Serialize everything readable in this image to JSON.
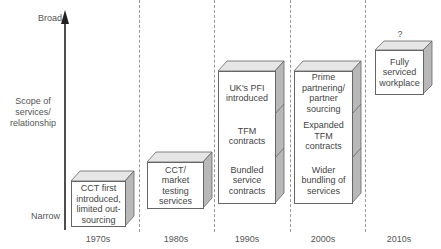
{
  "axis": {
    "top_label": "Broad",
    "middle_label": "Scope of services/ relationship",
    "bottom_label": "Narrow"
  },
  "eras": [
    {
      "label": "1970s",
      "boxes": [
        "CCT first introduced, limited out-sourcing"
      ]
    },
    {
      "label": "1980s",
      "boxes": [
        "CCT/ market testing services"
      ]
    },
    {
      "label": "1990s",
      "boxes": [
        "UK's PFI introduced",
        "TFM contracts",
        "Bundled service contracts"
      ]
    },
    {
      "label": "2000s",
      "boxes": [
        "Prime partnering/ partner sourcing",
        "Expanded TFM contracts",
        "Wider bundling of services"
      ]
    },
    {
      "label": "2010s",
      "boxes": [
        "Fully serviced workplace"
      ],
      "annotation": "?"
    }
  ],
  "colors": {
    "face": "#ffffff",
    "top": "#e6e6e6",
    "side": "#b8b8b8",
    "stroke": "#666666"
  }
}
